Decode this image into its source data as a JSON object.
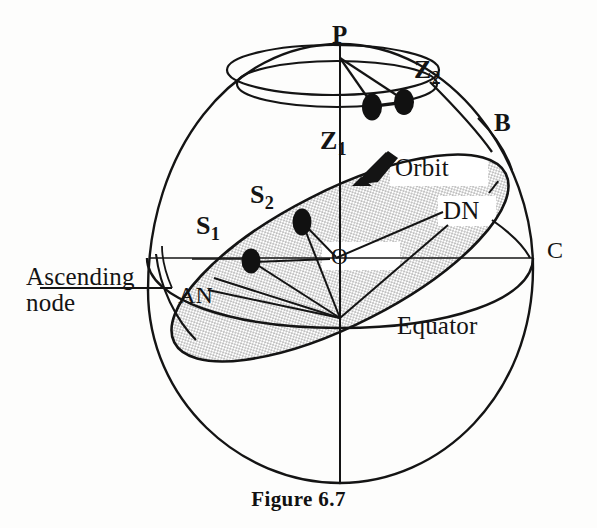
{
  "figure": {
    "caption": "Figure 6.7",
    "title_implied": "Satellite orbit geometry on the celestial sphere"
  },
  "labels": {
    "pole": "P",
    "zenith_1_base": "Z",
    "zenith_1_sub": "1",
    "zenith_2_base": "Z",
    "zenith_2_sub": "2",
    "sat_1_base": "S",
    "sat_1_sub": "1",
    "sat_2_base": "S",
    "sat_2_sub": "2",
    "center": "O",
    "point_b": "B",
    "point_c": "C",
    "orbit": "Orbit",
    "equator": "Equator",
    "descending_node": "DN",
    "ascending_node_abbrev": "AN",
    "ascending_node_line1": "Ascending",
    "ascending_node_line2": "node"
  },
  "colors": {
    "ink": "#141414",
    "stipple_fill": "#cccccc",
    "background": "#fdfdfc",
    "dot_fill": "#111111"
  },
  "geometry": {
    "sphere_center": {
      "x": 340,
      "y": 258
    },
    "sphere_radius_x": 193,
    "sphere_radius_y": 225,
    "pole_point": {
      "x": 340,
      "y": 52
    },
    "polar_cap_ellipse": {
      "cx": 335,
      "cy": 72,
      "rx": 104,
      "ry": 26
    },
    "equator_ellipse": {
      "cx": 340,
      "cy": 258,
      "rx": 193,
      "ry": 70
    },
    "orbit_ellipse": {
      "cx": 340,
      "cy": 258,
      "rx": 185,
      "ry": 66,
      "rotation_deg": -27
    },
    "satellite_dots": [
      {
        "name": "S1",
        "x": 251,
        "y": 261
      },
      {
        "name": "S2",
        "x": 302,
        "y": 222
      },
      {
        "name": "Z1",
        "x": 372,
        "y": 107
      },
      {
        "name": "Z2",
        "x": 404,
        "y": 103
      }
    ],
    "arrow_on_orbit": {
      "x": 372,
      "y": 168,
      "direction_deg": -28
    }
  }
}
